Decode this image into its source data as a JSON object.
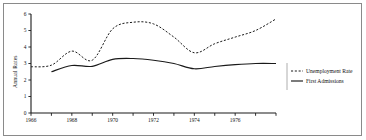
{
  "chart_data": {
    "type": "line",
    "title": "",
    "xlabel": "",
    "ylabel": "Annual Rates",
    "xlim": [
      1966,
      1978
    ],
    "ylim": [
      0,
      6
    ],
    "grid": false,
    "legend_position": "right",
    "x_tick_labels": [
      "1966",
      "1968",
      "1970",
      "1972",
      "1974",
      "1976"
    ],
    "x_tick_values": [
      1966,
      1968,
      1970,
      1972,
      1974,
      1976
    ],
    "x_minor_ticks": [
      1967,
      1969,
      1971,
      1973,
      1975,
      1977,
      1978
    ],
    "y_tick_labels": [
      "0",
      "1",
      "2",
      "3",
      "4",
      "5",
      "6"
    ],
    "y_tick_values": [
      0,
      1,
      2,
      3,
      4,
      5,
      6
    ],
    "x": [
      1966,
      1967,
      1968,
      1969,
      1970,
      1971,
      1972,
      1973,
      1974,
      1975,
      1976,
      1977,
      1978
    ],
    "series": [
      {
        "name": "Unemployment Rate",
        "style": "dashed",
        "x": [
          1966,
          1967,
          1968,
          1969,
          1970,
          1971,
          1972,
          1973,
          1974,
          1975,
          1976,
          1977,
          1978
        ],
        "values": [
          2.8,
          2.9,
          3.75,
          3.2,
          5.1,
          5.5,
          5.4,
          4.6,
          3.65,
          4.2,
          4.6,
          5.0,
          5.7
        ]
      },
      {
        "name": "First Admissions",
        "style": "solid",
        "x": [
          1967,
          1968,
          1969,
          1970,
          1971,
          1972,
          1973,
          1974,
          1975,
          1976,
          1977,
          1978
        ],
        "values": [
          2.5,
          2.88,
          2.83,
          3.25,
          3.3,
          3.2,
          3.0,
          2.68,
          2.82,
          2.93,
          3.0,
          3.0
        ]
      }
    ]
  },
  "legend": {
    "items": [
      {
        "label": "Unemployment Rate",
        "style": "dashed"
      },
      {
        "label": "First Admissions",
        "style": "solid"
      }
    ]
  }
}
